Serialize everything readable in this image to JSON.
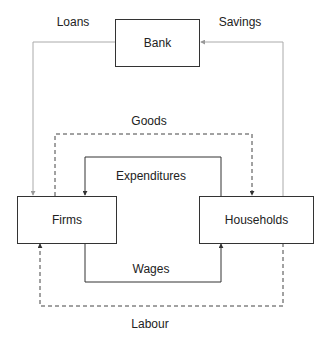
{
  "nodes": {
    "bank": "Bank",
    "firms": "Firms",
    "households": "Households"
  },
  "flows": {
    "loans": "Loans",
    "savings": "Savings",
    "goods": "Goods",
    "expenditures": "Expenditures",
    "wages": "Wages",
    "labour": "Labour"
  },
  "colors": {
    "solid_line": "#333333",
    "light_line": "#aaaaaa",
    "dashed_line": "#444444"
  }
}
